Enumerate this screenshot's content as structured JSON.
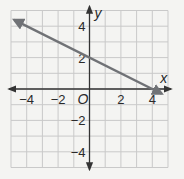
{
  "chart_data": {
    "type": "line",
    "title": "",
    "xlabel": "x",
    "ylabel": "y",
    "xlim": [
      -5,
      5
    ],
    "ylim": [
      -5,
      5
    ],
    "grid": true,
    "origin_label": "O",
    "x_tick_labels": [
      "−4",
      "−2",
      "2",
      "4"
    ],
    "x_ticks": [
      -4,
      -2,
      2,
      4
    ],
    "y_tick_labels": [
      "4",
      "2",
      "−2",
      "−4"
    ],
    "y_ticks": [
      4,
      2,
      -2,
      -4
    ],
    "series": [
      {
        "name": "line",
        "equation": "y = -0.5x + 2",
        "x": [
          -4.8,
          0,
          4,
          4.6
        ],
        "y": [
          4.4,
          2,
          0,
          -0.3
        ],
        "arrows": "both",
        "color": "#707276"
      }
    ]
  },
  "colors": {
    "background": "#f4f4f2",
    "grid": "#c9c9c9",
    "axis": "#333333",
    "line": "#707276"
  }
}
